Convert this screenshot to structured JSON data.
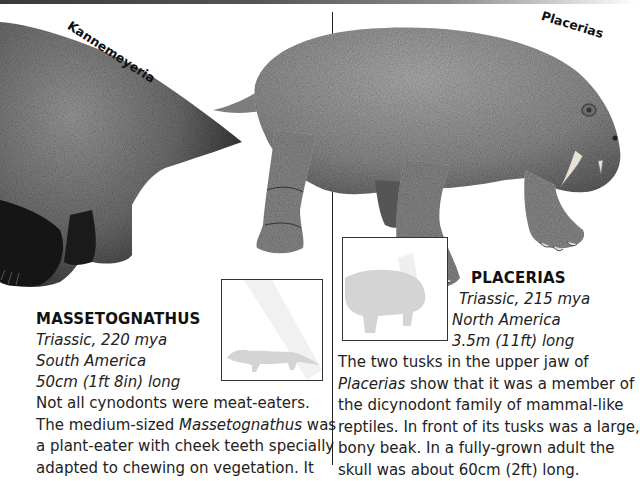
{
  "page": {
    "left_column": {
      "illustration_label": "Kannemeyeria",
      "species": {
        "name": "MASSETOGNATHUS",
        "period": "Triassic, 220 mya",
        "location": "South America",
        "size": "50cm (1ft 8in) long",
        "body_lines": [
          {
            "pre": "Not all cynodonts were meat-eaters.",
            "italic": "",
            "post": ""
          },
          {
            "pre": "The medium-sized ",
            "italic": "Massetognathus",
            "post": " was"
          },
          {
            "pre": "a plant-eater with cheek teeth specially",
            "italic": "",
            "post": ""
          },
          {
            "pre": "adapted to chewing on vegetation. It",
            "italic": "",
            "post": ""
          }
        ]
      },
      "scale_box": {
        "silhouette": "massetognathus-silhouette"
      }
    },
    "right_column": {
      "illustration_label": "Placerias",
      "species": {
        "name": "PLACERIAS",
        "period": "Triassic, 215 mya",
        "location": "North America",
        "size": "3.5m (11ft) long",
        "body_lines": [
          {
            "pre": "The two tusks in the upper jaw of",
            "italic": "",
            "post": ""
          },
          {
            "pre": "",
            "italic": "Placerias",
            "post": " show that it was a member of"
          },
          {
            "pre": "the dicynodont family of mammal-like",
            "italic": "",
            "post": ""
          },
          {
            "pre": "reptiles. In front of its tusks was a large,",
            "italic": "",
            "post": ""
          },
          {
            "pre": "bony beak. In a fully-grown adult the",
            "italic": "",
            "post": ""
          },
          {
            "pre": "skull was about 60cm (2ft) long.",
            "italic": "",
            "post": ""
          }
        ]
      },
      "scale_box": {
        "silhouette": "placerias-silhouette"
      }
    }
  },
  "colors": {
    "text": "#222222",
    "divider": "#222222",
    "silhouette": "#d4d4d4",
    "skin_light": "#9a9a9a",
    "skin_dark": "#1e1e1e"
  }
}
